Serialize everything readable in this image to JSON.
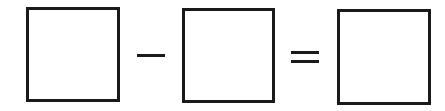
{
  "equation": {
    "operands": [
      {
        "id": "box-1",
        "value": ""
      },
      {
        "id": "box-2",
        "value": ""
      },
      {
        "id": "box-result",
        "value": ""
      }
    ],
    "operators": [
      "minus",
      "equals"
    ]
  },
  "colors": {
    "stroke": "#1a1a1a",
    "background": "#ffffff"
  }
}
